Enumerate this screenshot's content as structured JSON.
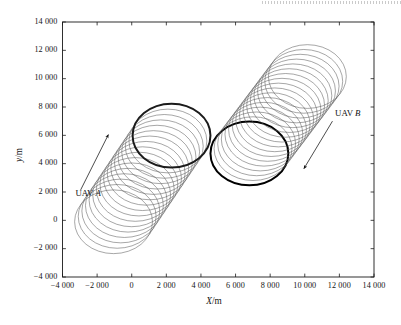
{
  "figure": {
    "kind": "scientific-plot",
    "background": "#ffffff",
    "axis_color": "#1a1a1a",
    "trail_color": "#5d5d5d",
    "highlight_color": "#000000"
  },
  "chart_data": {
    "type": "line",
    "title": "",
    "subtitle": "",
    "xlabel": "X/m",
    "xlabel_parts": {
      "symbol": "X",
      "unit": "/m"
    },
    "ylabel": "y/m",
    "ylabel_parts": {
      "symbol": "y",
      "unit": "/m"
    },
    "xlim": [
      -4000,
      14000
    ],
    "ylim": [
      -4000,
      14000
    ],
    "xticks": [
      -4000,
      -2000,
      0,
      2000,
      4000,
      6000,
      8000,
      10000,
      12000,
      14000
    ],
    "yticks": [
      -4000,
      -2000,
      0,
      2000,
      4000,
      6000,
      8000,
      10000,
      12000,
      14000
    ],
    "xtick_labels": [
      "-4 000",
      "-2 000",
      "0",
      "2 000",
      "4 000",
      "6 000",
      "8 000",
      "10 000",
      "12 000",
      "14 000"
    ],
    "ytick_labels": [
      "-4 000",
      "-2 000",
      "0",
      "2 000",
      "4 000",
      "6 000",
      "8 000",
      "10 000",
      "12 000",
      "14 000"
    ],
    "grid": false,
    "legend": "none",
    "tick_direction": "in",
    "frame": "box",
    "series": [
      {
        "name": "UAV A",
        "style": "loiter-spiral-track",
        "circle_radius": 2250,
        "circle_count": 17,
        "center_start": [
          -1050,
          -100
        ],
        "center_end": [
          2300,
          5980
        ],
        "highlight_circle_center": [
          2300,
          5980
        ],
        "highlight_at": "end",
        "color": "#5d5d5d",
        "highlight_color": "#1b1b1b"
      },
      {
        "name": "UAV B",
        "style": "loiter-spiral-track",
        "circle_radius": 2250,
        "circle_count": 17,
        "center_start": [
          6800,
          4720
        ],
        "center_end": [
          10150,
          10150
        ],
        "highlight_circle_center": [
          6800,
          4720
        ],
        "highlight_at": "start",
        "color": "#5d5d5d",
        "highlight_color": "#000000"
      }
    ],
    "annotations": [
      {
        "id": "uav-a",
        "text": "UAV A",
        "label_symbol": "UAV",
        "label_italic": "A",
        "text_x": -3250,
        "text_y": 1900,
        "arrow_from": [
          -2950,
          2150
        ],
        "arrow_to": [
          -1350,
          6050
        ],
        "arrow_head": "end"
      },
      {
        "id": "uav-b",
        "text": "UAV B",
        "label_symbol": "UAV",
        "label_italic": "B",
        "text_x": 11750,
        "text_y": 7550,
        "arrow_from": [
          11600,
          7000
        ],
        "arrow_to": [
          9950,
          3650
        ],
        "arrow_head": "end"
      }
    ]
  }
}
